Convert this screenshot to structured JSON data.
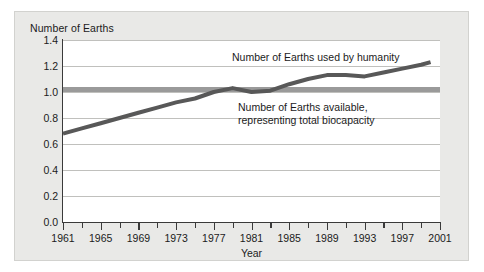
{
  "chart_data": {
    "type": "line",
    "title": "",
    "ylabel": "Number of Earths",
    "xlabel": "Year",
    "ylim": [
      0.0,
      1.4
    ],
    "xlim": [
      1961,
      2001
    ],
    "grid": true,
    "legend_position": "inline-annotation",
    "ytick_labels": [
      "0.0",
      "0.2",
      "0.4",
      "0.6",
      "0.8",
      "1.0",
      "1.2",
      "1.4"
    ],
    "ytick_values": [
      0.0,
      0.2,
      0.4,
      0.6,
      0.8,
      1.0,
      1.2,
      1.4
    ],
    "xtick_labels": [
      "1961",
      "1965",
      "1969",
      "1973",
      "1977",
      "1981",
      "1985",
      "1989",
      "1993",
      "1997",
      "2001"
    ],
    "xtick_values": [
      1961,
      1965,
      1969,
      1973,
      1977,
      1981,
      1985,
      1989,
      1993,
      1997,
      2001
    ],
    "xtick_minor_values": [
      1963,
      1967,
      1971,
      1975,
      1979,
      1983,
      1987,
      1991,
      1995,
      1999
    ],
    "annotations": [
      {
        "id": "humanity",
        "text": "Number of Earths used by humanity",
        "color": "#555555"
      },
      {
        "id": "biocapacity",
        "line1": "Number of Earths available,",
        "line2": "representing total biocapacity",
        "color": "#999999"
      }
    ],
    "series": [
      {
        "name": "Number of Earths used by humanity",
        "color": "#585858",
        "linewidth": 4,
        "x": [
          1961,
          1963,
          1965,
          1967,
          1969,
          1971,
          1973,
          1975,
          1977,
          1979,
          1981,
          1983,
          1985,
          1987,
          1989,
          1991,
          1993,
          1995,
          1997,
          1999,
          2000
        ],
        "values": [
          0.68,
          0.72,
          0.76,
          0.8,
          0.84,
          0.88,
          0.92,
          0.95,
          1.0,
          1.03,
          1.0,
          1.01,
          1.06,
          1.1,
          1.13,
          1.13,
          1.12,
          1.15,
          1.18,
          1.21,
          1.23
        ]
      },
      {
        "name": "Number of Earths available, representing total biocapacity",
        "color": "#9a9a9a",
        "linewidth": 5,
        "x": [
          1961,
          2001
        ],
        "values": [
          1.02,
          1.02
        ]
      }
    ]
  }
}
